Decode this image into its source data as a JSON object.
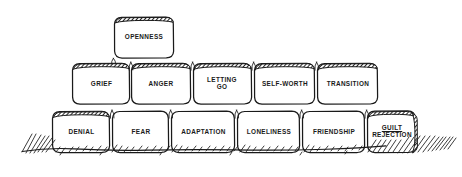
{
  "diagram": {
    "style": "hand-drawn ink sketch",
    "background_color": "#ffffff",
    "ink_color": "#1a1a1a",
    "rows": [
      {
        "row_name": "top-row",
        "blocks": [
          {
            "id": "openness",
            "label": "OPENNESS",
            "underline": false
          }
        ]
      },
      {
        "row_name": "middle-row",
        "blocks": [
          {
            "id": "grief",
            "label": "GRIEF",
            "underline": false
          },
          {
            "id": "anger",
            "label": "ANGER",
            "underline": false
          },
          {
            "id": "letting-go",
            "label": "LETTING\nGO",
            "underline": false
          },
          {
            "id": "self-worth",
            "label": "SELF-WORTH",
            "underline": false
          },
          {
            "id": "transition",
            "label": "TRANSITION",
            "underline": false
          }
        ]
      },
      {
        "row_name": "bottom-row",
        "blocks": [
          {
            "id": "denial",
            "label": "DENIAL",
            "underline": false
          },
          {
            "id": "fear",
            "label": "FEAR",
            "underline": false
          },
          {
            "id": "adaptation",
            "label": "ADAPTATION",
            "underline": false
          },
          {
            "id": "loneliness",
            "label": "LONELINESS",
            "underline": false
          },
          {
            "id": "friendship",
            "label": "FRIENDSHIP",
            "underline": false
          },
          {
            "id": "guilt-rejection",
            "label_line1": "GUILT",
            "label_line2": "REJECTION",
            "underline": true
          }
        ]
      }
    ],
    "ground": {
      "name": "ground-line",
      "description": "hand-drawn ground line with hatch marks"
    }
  }
}
